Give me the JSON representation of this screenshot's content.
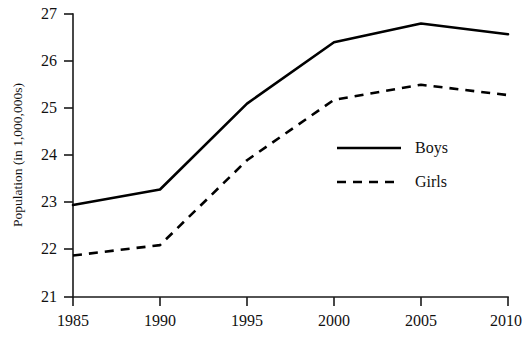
{
  "chart_data": {
    "type": "line",
    "title": "",
    "xlabel": "",
    "ylabel": "Population (in 1,000,000s)",
    "categories": [
      "1985",
      "1990",
      "1995",
      "2000",
      "2005",
      "2010"
    ],
    "x": [
      1985,
      1990,
      1995,
      2000,
      2005,
      2010
    ],
    "xlim": [
      1985,
      2010
    ],
    "ylim": [
      21,
      27
    ],
    "yticks": [
      "27",
      "26",
      "25",
      "24",
      "23",
      "22",
      "21"
    ],
    "ytick_values": [
      27,
      26,
      25,
      24,
      23,
      22,
      21
    ],
    "xticks": [
      "1985",
      "1990",
      "1995",
      "2000",
      "2005",
      "2010"
    ],
    "grid": false,
    "legend_position": "center-right-inside",
    "series": [
      {
        "name": "Boys",
        "style": "solid",
        "color": "#000000",
        "values": [
          22.95,
          23.28,
          25.1,
          26.4,
          26.8,
          26.57
        ]
      },
      {
        "name": "Girls",
        "style": "dashed",
        "color": "#000000",
        "values": [
          21.88,
          22.1,
          23.9,
          25.18,
          25.5,
          25.28
        ]
      }
    ]
  },
  "legend": {
    "items": [
      {
        "label": "Boys",
        "style": "solid"
      },
      {
        "label": "Girls",
        "style": "dashed"
      }
    ]
  }
}
